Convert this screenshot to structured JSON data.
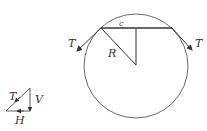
{
  "diagram": {
    "labels": {
      "chord": "c",
      "radius": "R",
      "tension_left": "T",
      "tension_right": "T",
      "triangle_T": "T",
      "triangle_V": "V",
      "triangle_H": "H"
    },
    "colors": {
      "stroke": "#333333",
      "background": "#ffffff"
    }
  }
}
